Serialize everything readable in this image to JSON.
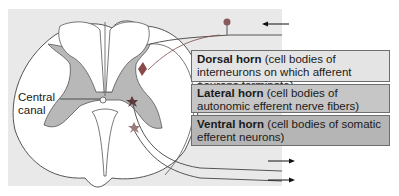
{
  "figure": {
    "labels": {
      "central_canal": [
        "Central",
        "canal"
      ],
      "dorsal": {
        "bold": "Dorsal horn",
        "rest": " (cell bodies of interneurons on which afferent neurons terminate)"
      },
      "lateral": {
        "bold": "Lateral horn",
        "rest": " (cell bodies of autonomic efferent nerve fibers)"
      },
      "ventral": {
        "bold": "Ventral horn",
        "rest": " (cell bodies of somatic efferent neurons)"
      }
    },
    "arrows": {
      "afferent_in": "left",
      "efferent_out_1": "right",
      "efferent_out_2": "right"
    },
    "colors": {
      "panel": "#e9e9e9",
      "gray_matter": "#b8b8b8",
      "white_matter": "#ffffff",
      "outline": "#555555",
      "dorsal_box": "#e4e4e4",
      "lateral_box": "#c6c6c6",
      "ventral_box": "#b5b5b5",
      "neuron": "#7a4a4a"
    }
  }
}
